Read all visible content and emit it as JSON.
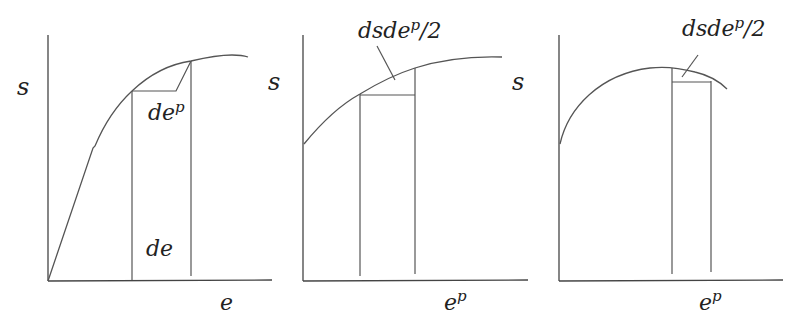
{
  "figure": {
    "panels": [
      {
        "id": "panel-1",
        "y_label": "s",
        "x_label": "e",
        "annotations": {
          "plastic_increment": {
            "base": "de",
            "sup": "p"
          },
          "total_increment": "de"
        }
      },
      {
        "id": "panel-2",
        "y_label": "s",
        "x_label": {
          "base": "e",
          "sup": "p"
        },
        "annotations": {
          "area_label": {
            "base": "dsde",
            "sup": "p",
            "tail": "/2"
          }
        }
      },
      {
        "id": "panel-3",
        "y_label": "s",
        "x_label": {
          "base": "e",
          "sup": "p"
        },
        "annotations": {
          "area_label": {
            "base": "dsde",
            "sup": "p",
            "tail": "/2"
          }
        }
      }
    ],
    "colors": {
      "line": "#555555",
      "axis": "#444444",
      "text": "#222222",
      "background": "#ffffff"
    }
  }
}
